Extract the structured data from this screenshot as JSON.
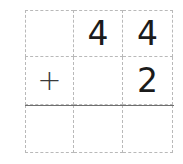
{
  "worksheet": {
    "type": "vertical-addition",
    "columns": 3,
    "rows": 3,
    "grid": [
      [
        {
          "name": "cell-r1c1",
          "text": ""
        },
        {
          "name": "cell-r1c2",
          "text": "4"
        },
        {
          "name": "cell-r1c3",
          "text": "4"
        }
      ],
      [
        {
          "name": "cell-r2c1",
          "text": "+"
        },
        {
          "name": "cell-r2c2",
          "text": ""
        },
        {
          "name": "cell-r2c3",
          "text": "2"
        }
      ],
      [
        {
          "name": "cell-r3c1",
          "text": ""
        },
        {
          "name": "cell-r3c2",
          "text": ""
        },
        {
          "name": "cell-r3c3",
          "text": ""
        }
      ]
    ],
    "addend_top": "44",
    "operator": "+",
    "addend_bottom": "2",
    "sum": "",
    "colors": {
      "grid_line": "#b9b9b9",
      "rule_line": "#6f6f6f",
      "digit": "#1b1b1b",
      "operator": "#3a3a3a",
      "background": "#ffffff"
    }
  }
}
